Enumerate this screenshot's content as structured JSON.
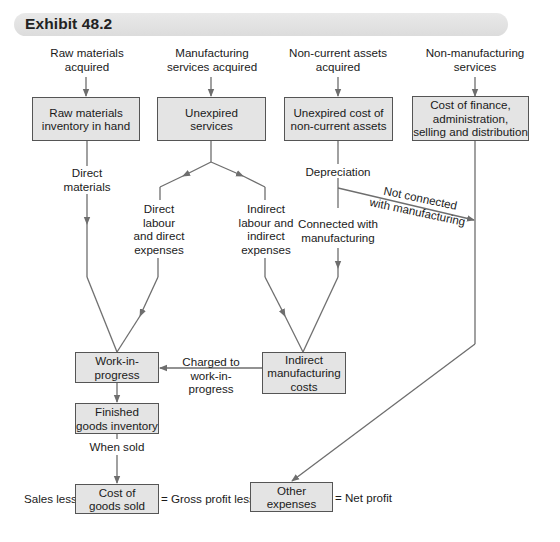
{
  "header": {
    "title": "Exhibit 48.2"
  },
  "sources": {
    "raw_materials": "Raw materials\nacquired",
    "manufacturing_services": "Manufacturing\nservices acquired",
    "non_current_assets": "Non-current assets\nacquired",
    "non_manufacturing_services": "Non-manufacturing\nservices"
  },
  "boxes": {
    "raw_materials_inventory": "Raw materials\ninventory in hand",
    "unexpired_services": "Unexpired\nservices",
    "unexpired_cost_assets": "Unexpired cost of\nnon-current assets",
    "cost_of_finance": "Cost of finance,\nadministration,\nselling and distribution",
    "work_in_progress": "Work-in-\nprogress",
    "indirect_manufacturing_costs": "Indirect\nmanufacturing\ncosts",
    "finished_goods_inventory": "Finished\ngoods inventory",
    "cost_of_goods_sold": "Cost of\ngoods sold",
    "other_expenses": "Other expenses"
  },
  "edge_labels": {
    "direct_materials": "Direct\nmaterials",
    "direct_labour": "Direct\nlabour\nand direct\nexpenses",
    "indirect_labour": "Indirect\nlabour and\nindirect\nexpenses",
    "depreciation": "Depreciation",
    "connected_with_manufacturing": "Connected with\nmanufacturing",
    "not_connected": "Not connected\nwith manufacturing",
    "charged_to_wip": "Charged to\nwork-in-progress",
    "when_sold": "When sold"
  },
  "equation": {
    "sales_less": "Sales less",
    "gross_profit_less": "= Gross profit less",
    "net_profit": "= Net profit"
  },
  "colors": {
    "box_fill": "#e4e4e4",
    "box_border": "#555555",
    "line": "#6e6e6e",
    "header_bg": "#e2e2e2"
  }
}
